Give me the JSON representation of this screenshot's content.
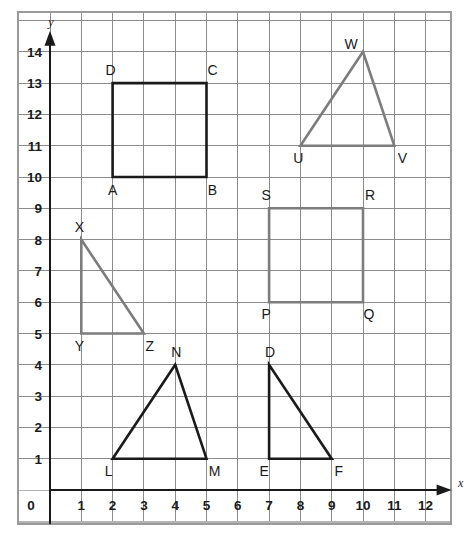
{
  "chart_data": {
    "type": "scatter",
    "title": "",
    "xlabel": "x",
    "ylabel": "y",
    "xlim": [
      0,
      12
    ],
    "ylim": [
      0,
      14
    ],
    "grid": true,
    "legend": "none",
    "x_ticks": [
      "0",
      "1",
      "2",
      "3",
      "4",
      "5",
      "6",
      "7",
      "8",
      "9",
      "10",
      "11",
      "12"
    ],
    "y_ticks": [
      "0",
      "1",
      "2",
      "3",
      "4",
      "5",
      "6",
      "7",
      "8",
      "9",
      "10",
      "11",
      "12",
      "13",
      "14"
    ],
    "shapes": [
      {
        "name": "square-abcd",
        "kind": "square",
        "color": "#1a1a1a",
        "closed": true,
        "vertices": [
          {
            "label": "A",
            "x": 2,
            "y": 10,
            "label_dx": 0,
            "label_dy": 18
          },
          {
            "label": "B",
            "x": 5,
            "y": 10,
            "label_dx": 6,
            "label_dy": 18
          },
          {
            "label": "C",
            "x": 5,
            "y": 13,
            "label_dx": 6,
            "label_dy": -8
          },
          {
            "label": "D",
            "x": 2,
            "y": 13,
            "label_dx": -2,
            "label_dy": -8
          }
        ]
      },
      {
        "name": "triangle-uvw",
        "kind": "triangle",
        "color": "#7d7d7d",
        "closed": true,
        "vertices": [
          {
            "label": "U",
            "x": 8,
            "y": 11,
            "label_dx": -2,
            "label_dy": 17
          },
          {
            "label": "V",
            "x": 11,
            "y": 11,
            "label_dx": 8,
            "label_dy": 17
          },
          {
            "label": "W",
            "x": 10,
            "y": 14,
            "label_dx": -12,
            "label_dy": -3
          }
        ]
      },
      {
        "name": "triangle-xyz",
        "kind": "triangle",
        "color": "#7d7d7d",
        "closed": true,
        "vertices": [
          {
            "label": "X",
            "x": 1,
            "y": 8,
            "label_dx": -2,
            "label_dy": -8
          },
          {
            "label": "Y",
            "x": 1,
            "y": 5,
            "label_dx": -2,
            "label_dy": 17
          },
          {
            "label": "Z",
            "x": 3,
            "y": 5,
            "label_dx": 6,
            "label_dy": 17
          }
        ]
      },
      {
        "name": "square-pqrs",
        "kind": "square",
        "color": "#7d7d7d",
        "closed": true,
        "vertices": [
          {
            "label": "P",
            "x": 7,
            "y": 6,
            "label_dx": -3,
            "label_dy": 17
          },
          {
            "label": "Q",
            "x": 10,
            "y": 6,
            "label_dx": 6,
            "label_dy": 17
          },
          {
            "label": "R",
            "x": 10,
            "y": 9,
            "label_dx": 7,
            "label_dy": -8
          },
          {
            "label": "S",
            "x": 7,
            "y": 9,
            "label_dx": -3,
            "label_dy": -8
          }
        ]
      },
      {
        "name": "triangle-lmn",
        "kind": "triangle",
        "color": "#1a1a1a",
        "closed": true,
        "vertices": [
          {
            "label": "L",
            "x": 2,
            "y": 1,
            "label_dx": -4,
            "label_dy": 17
          },
          {
            "label": "M",
            "x": 5,
            "y": 1,
            "label_dx": 8,
            "label_dy": 17
          },
          {
            "label": "N",
            "x": 4,
            "y": 4,
            "label_dx": 1,
            "label_dy": -8
          }
        ]
      },
      {
        "name": "triangle-def",
        "kind": "triangle",
        "color": "#1a1a1a",
        "closed": true,
        "vertices": [
          {
            "label": "E",
            "x": 7,
            "y": 1,
            "label_dx": -5,
            "label_dy": 17
          },
          {
            "label": "F",
            "x": 9,
            "y": 1,
            "label_dx": 7,
            "label_dy": 17
          },
          {
            "label": "D",
            "x": 7,
            "y": 4,
            "label_dx": 1,
            "label_dy": -8
          }
        ]
      }
    ]
  },
  "colors": {
    "shape_black": "#1a1a1a",
    "shape_gray": "#7d7d7d",
    "grid": "#8c8c8c",
    "grid_light": "#b4b4b4",
    "axis": "#1a1a1a",
    "frame": "#9a9a9a",
    "background": "#ffffff"
  },
  "axes": {
    "x_name": "x",
    "y_name": "y"
  },
  "geometry": {
    "origin_px": {
      "x": 50,
      "y": 490
    },
    "unit_px": 31.3,
    "frame": {
      "left": 18,
      "top": 12,
      "right": 451,
      "bottom": 524
    },
    "grid_cols": 14,
    "grid_rows": 17
  }
}
